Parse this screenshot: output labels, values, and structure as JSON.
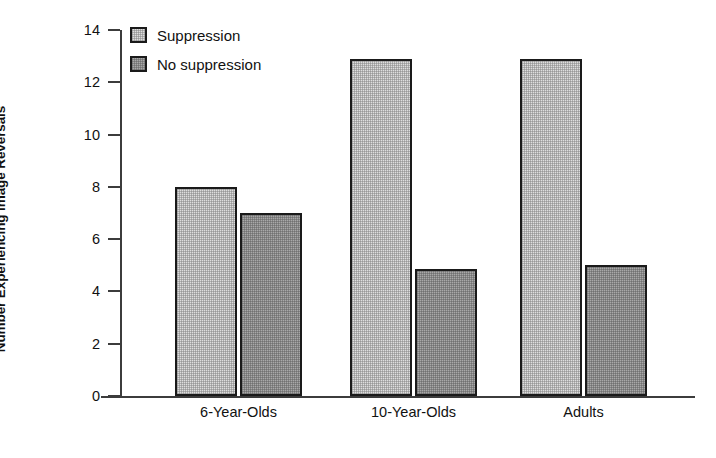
{
  "chart_data": {
    "type": "bar",
    "title": "",
    "xlabel": "",
    "ylabel": "Number Experiencing Image Reversals",
    "ylim": [
      0,
      14
    ],
    "ytick_step": 2,
    "yticks": [
      0,
      2,
      4,
      6,
      8,
      10,
      12,
      14
    ],
    "ytick_labels": [
      "0",
      "2",
      "4",
      "6",
      "8",
      "10",
      "12",
      "14"
    ],
    "categories": [
      "6-Year-Olds",
      "10-Year-Olds",
      "Adults"
    ],
    "grid": false,
    "legend_position": "top-left",
    "series": [
      {
        "name": "Suppression",
        "color": "#dedede",
        "values": [
          8.0,
          12.9,
          12.9
        ]
      },
      {
        "name": "No suppression",
        "color": "#a9a9a9",
        "values": [
          7.0,
          4.85,
          5.0
        ]
      }
    ]
  },
  "legend": {
    "items": [
      {
        "label": "Suppression",
        "swatch": "light-gray-swatch"
      },
      {
        "label": "No suppression",
        "swatch": "dark-gray-swatch"
      }
    ]
  },
  "axis": {
    "y_title": "Number Experiencing Image Reversals",
    "y_labels": [
      "14",
      "12",
      "10",
      "8",
      "6",
      "4",
      "2",
      "0"
    ],
    "x_labels": [
      "6-Year-Olds",
      "10-Year-Olds",
      "Adults"
    ]
  },
  "colors": {
    "axis": "#3c3c3c",
    "bar_outline": "#1a1a1a",
    "suppression_fill": "#dedede",
    "no_suppression_fill": "#a9a9a9",
    "background": "#ffffff",
    "text": "#111111"
  }
}
